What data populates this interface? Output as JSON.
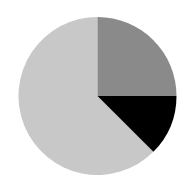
{
  "figure": {
    "background_color": "#ffffff",
    "width": 195,
    "height": 190
  },
  "chart_data": {
    "type": "pie",
    "title": "",
    "subtitle": "",
    "xlabel": "",
    "ylabel": "",
    "legend": "none",
    "grid": false,
    "labels": [
      "Slice 1",
      "Slice 2",
      "Slice 3"
    ],
    "values": [
      62.5,
      25.0,
      12.5
    ],
    "raw_ratio": [
      5,
      2,
      1
    ],
    "units": "percent",
    "colors": [
      "#c8c8c8",
      "#8a8a8a",
      "#000000"
    ],
    "start_angle_deg": 0,
    "direction": "clockwise",
    "slice_angles_deg": [
      225,
      90,
      45
    ],
    "slices": [
      {
        "label": "Slice 1",
        "value": 62.5,
        "color": "#c8c8c8",
        "start_deg": 135,
        "sweep_deg": 225,
        "name": "light-gray-slice"
      },
      {
        "label": "Slice 2",
        "value": 25.0,
        "color": "#8a8a8a",
        "start_deg": 0,
        "sweep_deg": 90,
        "name": "dark-gray-slice"
      },
      {
        "label": "Slice 3",
        "value": 12.5,
        "color": "#000000",
        "start_deg": 90,
        "sweep_deg": 45,
        "name": "black-slice"
      }
    ],
    "geometry": {
      "center_x": 97.5,
      "center_y": 96,
      "radius": 79
    }
  }
}
